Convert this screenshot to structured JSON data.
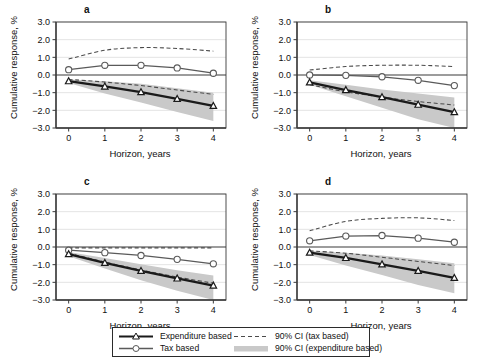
{
  "figure": {
    "axis": {
      "ylabel": "Cumulative response, %",
      "xlabel": "Horizon, years",
      "yticks": [
        "3.0",
        "2.0",
        "1.0",
        "0.0",
        "-1.0",
        "-2.0",
        "-3.0"
      ],
      "xticks": [
        "0",
        "1",
        "2",
        "3",
        "4"
      ],
      "ylim": [
        -3.0,
        3.0
      ],
      "xlim": [
        -0.35,
        4.35
      ]
    },
    "legend": {
      "entries": [
        {
          "label": "Expenditure based",
          "style": "solid-black-triangle"
        },
        {
          "label": "Tax based",
          "style": "solid-gray-circle"
        },
        {
          "label": "90% CI (tax based)",
          "style": "dashed-line"
        },
        {
          "label": "90% CI (expenditure based)",
          "style": "gray-band"
        }
      ]
    },
    "colors": {
      "expenditure_line": "#1a1a1a",
      "tax_line": "#5a5a5a",
      "ci_tax_dashed": "#4a4a4a",
      "ci_expenditure_band": "#c9c9c9",
      "axis": "#3a3a3a",
      "grid": "#d9d9d9",
      "background": "#ffffff"
    }
  },
  "chart_data": [
    {
      "type": "line",
      "panel": "a",
      "title": "a",
      "xlabel": "Horizon, years",
      "ylabel": "Cumulative response, %",
      "x": [
        0,
        1,
        2,
        3,
        4
      ],
      "ylim": [
        -3.0,
        3.0
      ],
      "grid": true,
      "legend_position": "figure-bottom",
      "series": [
        {
          "name": "Expenditure based",
          "values": [
            -0.35,
            -0.65,
            -0.97,
            -1.35,
            -1.75
          ]
        },
        {
          "name": "Tax based",
          "values": [
            0.3,
            0.55,
            0.55,
            0.4,
            0.1
          ]
        },
        {
          "name": "90% CI (tax based) upper",
          "values": [
            0.9,
            1.4,
            1.55,
            1.5,
            1.35
          ]
        },
        {
          "name": "90% CI (tax based) lower",
          "values": [
            -0.25,
            -0.4,
            -0.6,
            -0.85,
            -1.1
          ]
        },
        {
          "name": "90% CI (expenditure based) upper",
          "values": [
            -0.25,
            -0.35,
            -0.5,
            -0.75,
            -1.0
          ]
        },
        {
          "name": "90% CI (expenditure based) lower",
          "values": [
            -0.45,
            -1.05,
            -1.55,
            -2.1,
            -2.6
          ]
        }
      ]
    },
    {
      "type": "line",
      "panel": "b",
      "title": "b",
      "xlabel": "Horizon, years",
      "ylabel": "Cumulative response, %",
      "x": [
        0,
        1,
        2,
        3,
        4
      ],
      "ylim": [
        -3.0,
        3.0
      ],
      "grid": true,
      "legend_position": "figure-bottom",
      "series": [
        {
          "name": "Expenditure based",
          "values": [
            -0.42,
            -0.85,
            -1.25,
            -1.68,
            -2.1
          ]
        },
        {
          "name": "Tax based",
          "values": [
            0.0,
            -0.02,
            -0.1,
            -0.3,
            -0.6
          ]
        },
        {
          "name": "90% CI (tax based) upper",
          "values": [
            0.28,
            0.48,
            0.55,
            0.55,
            0.48
          ]
        },
        {
          "name": "90% CI (tax based) lower",
          "values": [
            -0.55,
            -0.95,
            -1.25,
            -1.5,
            -1.7
          ]
        },
        {
          "name": "90% CI (expenditure based) upper",
          "values": [
            -0.3,
            -0.55,
            -0.82,
            -1.05,
            -1.28
          ]
        },
        {
          "name": "90% CI (expenditure based) lower",
          "values": [
            -0.55,
            -1.2,
            -1.85,
            -2.5,
            -3.05
          ]
        }
      ]
    },
    {
      "type": "line",
      "panel": "c",
      "title": "c",
      "xlabel": "Horizon, years",
      "ylabel": "Cumulative response, %",
      "x": [
        0,
        1,
        2,
        3,
        4
      ],
      "ylim": [
        -3.0,
        3.0
      ],
      "grid": true,
      "legend_position": "figure-bottom",
      "series": [
        {
          "name": "Expenditure based",
          "values": [
            -0.4,
            -0.9,
            -1.35,
            -1.78,
            -2.18
          ]
        },
        {
          "name": "Tax based",
          "values": [
            -0.18,
            -0.32,
            -0.48,
            -0.7,
            -0.95
          ]
        },
        {
          "name": "90% CI (tax based) upper",
          "values": [
            -0.05,
            -0.05,
            -0.05,
            -0.05,
            -0.05
          ]
        },
        {
          "name": "90% CI (tax based) lower",
          "values": [
            -0.35,
            -0.85,
            -1.3,
            -1.7,
            -2.05
          ]
        },
        {
          "name": "90% CI (expenditure based) upper",
          "values": [
            -0.28,
            -0.62,
            -0.98,
            -1.32,
            -1.62
          ]
        },
        {
          "name": "90% CI (expenditure based) lower",
          "values": [
            -0.52,
            -1.22,
            -1.88,
            -2.48,
            -3.0
          ]
        }
      ]
    },
    {
      "type": "line",
      "panel": "d",
      "title": "d",
      "xlabel": "Horizon, years",
      "ylabel": "Cumulative response, %",
      "x": [
        0,
        1,
        2,
        3,
        4
      ],
      "ylim": [
        -3.0,
        3.0
      ],
      "grid": true,
      "legend_position": "figure-bottom",
      "series": [
        {
          "name": "Expenditure based",
          "values": [
            -0.32,
            -0.62,
            -0.98,
            -1.35,
            -1.75
          ]
        },
        {
          "name": "Tax based",
          "values": [
            0.35,
            0.62,
            0.65,
            0.5,
            0.27
          ]
        },
        {
          "name": "90% CI (tax based) upper",
          "values": [
            0.92,
            1.45,
            1.62,
            1.65,
            1.5
          ]
        },
        {
          "name": "90% CI (tax based) lower",
          "values": [
            -0.22,
            -0.35,
            -0.58,
            -0.82,
            -1.05
          ]
        },
        {
          "name": "90% CI (expenditure based) upper",
          "values": [
            -0.22,
            -0.32,
            -0.48,
            -0.7,
            -0.92
          ]
        },
        {
          "name": "90% CI (expenditure based) lower",
          "values": [
            -0.45,
            -1.05,
            -1.58,
            -2.15,
            -2.62
          ]
        }
      ]
    }
  ]
}
